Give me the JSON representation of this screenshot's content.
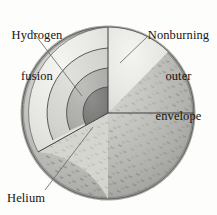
{
  "figure": {
    "background_color": "#fdfdfc"
  },
  "labels": {
    "hydrogen": {
      "line1": "Hydrogen",
      "line2": "fusion"
    },
    "envelope": {
      "line1": "Nonburning",
      "line2": "outer",
      "line3": "envelope"
    },
    "helium": {
      "text": "Helium"
    }
  },
  "layers": [
    {
      "name": "outer-envelope",
      "label": "Nonburning outer envelope",
      "color": "#b9b9b5"
    },
    {
      "name": "hydrogen-fusion-shell",
      "label": "Hydrogen fusion",
      "color": "#d8d8d4"
    },
    {
      "name": "helium-shell",
      "label": "Helium",
      "color": "#b0b0ac"
    },
    {
      "name": "core",
      "label": "Core",
      "color": "#7e7e7c"
    }
  ],
  "colors": {
    "stroke": "#4a4a4a",
    "leader": "#666666",
    "text": "#141414",
    "cut_face_light": "#eeeeea",
    "cut_face_mid": "#dcdcd8",
    "speckle": "#8a8a86"
  }
}
